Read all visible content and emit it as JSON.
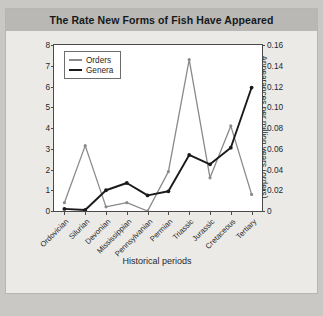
{
  "chart_data": {
    "type": "line",
    "title": "The Rate New Forms of Fish Have Appeared",
    "xlabel": "Historical periods",
    "ylabel": "Appearances per million years (genera)",
    "ylabel_secondary": "Appearances per million years (orders)",
    "categories": [
      "Ordovician",
      "Silurian",
      "Devonian",
      "Mississippian",
      "Pennsylvanian",
      "Permian",
      "Triassic",
      "Jurassic",
      "Cretaceous",
      "Tertiary"
    ],
    "ylim": [
      0,
      8
    ],
    "yticks": [
      "0",
      "1",
      "2",
      "3",
      "4",
      "5",
      "6",
      "7",
      "8"
    ],
    "ylim_secondary": [
      0,
      0.16
    ],
    "yticks_secondary": [
      "0",
      "0.02",
      "0.04",
      "0.06",
      "0.08",
      "0.10",
      "0.12",
      "0.14",
      "0.16"
    ],
    "grid": false,
    "legend_position": "top-left",
    "series": [
      {
        "name": "Orders",
        "axis": "secondary",
        "color": "#8a8a8a",
        "values": [
          0.008,
          0.063,
          0.004,
          0.008,
          0.0,
          0.038,
          0.146,
          0.032,
          0.082,
          0.016
        ]
      },
      {
        "name": "Genera",
        "axis": "primary",
        "color": "#1a1a1a",
        "values": [
          0.1,
          0.05,
          1.0,
          1.35,
          0.75,
          0.95,
          2.7,
          2.25,
          3.05,
          5.95
        ]
      }
    ]
  },
  "colors": {
    "page_background": "#c9c8c4",
    "figure_background": "#eceae6",
    "title_bar": "#b9b8b4",
    "plot_background": "#ffffff",
    "axis": "#4a4a4a",
    "orders": "#8a8a8a",
    "genera": "#1a1a1a"
  }
}
